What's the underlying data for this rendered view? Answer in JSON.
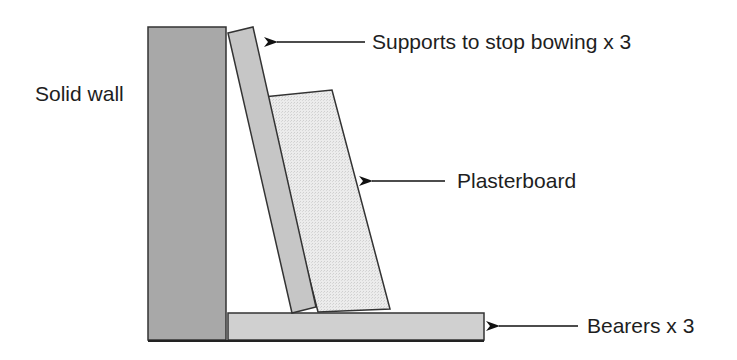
{
  "diagram": {
    "components": {
      "wall": {
        "label": "Solid wall",
        "fill": "#a8a8a8"
      },
      "support": {
        "label": "Supports to stop bowing x 3",
        "fill": "#c6c6c6"
      },
      "plasterboard": {
        "label": "Plasterboard",
        "fill": "#e6e6e6"
      },
      "bearer": {
        "label": "Bearers x 3",
        "fill": "#d0d0d0"
      }
    },
    "colors": {
      "outline": "#333333",
      "text": "#1e1e1e",
      "arrow": "#111111"
    }
  }
}
